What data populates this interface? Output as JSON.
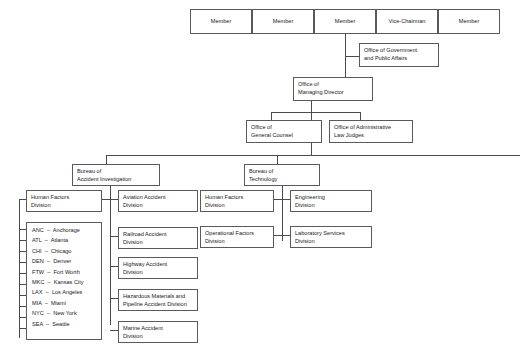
{
  "chart": {
    "type": "organization-chart",
    "board_members": [
      {
        "id": "member-1",
        "label": "Member"
      },
      {
        "id": "member-2",
        "label": "Member"
      },
      {
        "id": "member-3",
        "label": "Member"
      },
      {
        "id": "vice-chairman",
        "label": "Vice-Chairman"
      },
      {
        "id": "member-5",
        "label": "Member"
      }
    ],
    "offices": {
      "government_public_affairs": "Office of Government\nand Public Affairs",
      "managing_director": "Office of\nManaging Director",
      "general_counsel": "Office of\nGeneral Counsel",
      "administrative_law_judges": "Office of Administrative\nLaw Judges"
    },
    "bureaus": {
      "accident_investigation": "Bureau of\nAccident Investigation",
      "technology": "Bureau of\nTechnology"
    },
    "accident_investigation_divisions": {
      "regional": "Human Factors\nDivision",
      "modal": [
        "Aviation Accident\nDivision",
        "Railroad Accident\nDivision",
        "Highway Accident\nDivision",
        "Hazardous Materials and\nPipeline Accident Division",
        "Marine Accident\nDivision"
      ]
    },
    "technology_divisions": {
      "column_left": [
        "Human Factors\nDivision",
        "Operational Factors\nDivision"
      ],
      "column_right": [
        "Engineering\nDivision",
        "Laboratory Services\nDivision"
      ]
    },
    "field_offices": [
      "ANC  –  Anchorage",
      "ATL  –  Atlanta",
      "CHI  –  Chicago",
      "DEN  –  Denver",
      "FTW  –  Fort Worth",
      "MKC  –  Kansas City",
      "LAX  –  Los Angeles",
      "MIA  –  Miami",
      "NYC  –  New York",
      "SEA  –  Seattle"
    ],
    "colors": {
      "border": "#5a5a5e",
      "connector": "#4a4a4f",
      "text": "#1a1a1a",
      "background": "#ffffff"
    }
  }
}
